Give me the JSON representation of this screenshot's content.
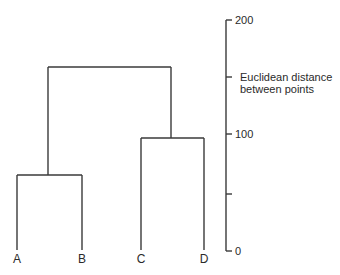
{
  "diagram": {
    "type": "dendrogram",
    "leaves": [
      {
        "label": "A",
        "x": 17
      },
      {
        "label": "B",
        "x": 82
      },
      {
        "label": "C",
        "x": 141
      },
      {
        "label": "D",
        "x": 204
      }
    ],
    "merges": [
      {
        "children": [
          "A",
          "B"
        ],
        "height": 65
      },
      {
        "children": [
          "C",
          "D"
        ],
        "height": 98
      },
      {
        "children": [
          "AB",
          "CD"
        ],
        "height": 160
      }
    ],
    "axis": {
      "label_line1": "Euclidean distance",
      "label_line2": "between points",
      "ticks": [
        {
          "value": 200,
          "label": "200"
        },
        {
          "value": 150,
          "label": ""
        },
        {
          "value": 100,
          "label": "100"
        },
        {
          "value": 50,
          "label": ""
        },
        {
          "value": 0,
          "label": "0"
        }
      ],
      "range": [
        0,
        200
      ]
    }
  }
}
